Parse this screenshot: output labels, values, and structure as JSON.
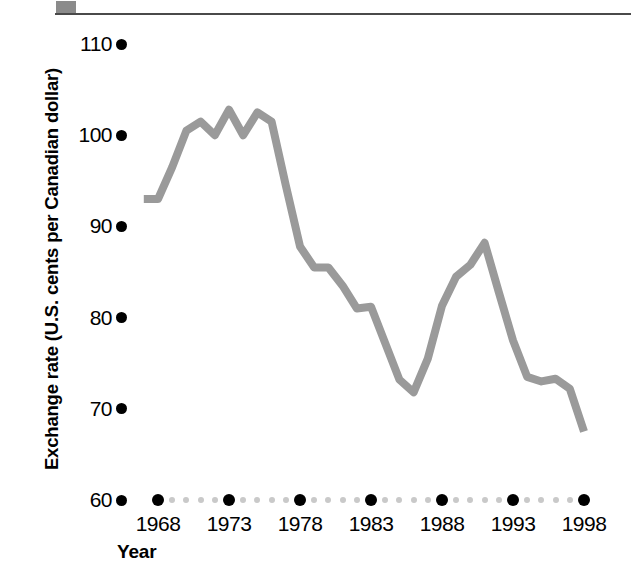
{
  "chart_data": {
    "type": "line",
    "title": "",
    "xlabel": "Year",
    "ylabel": "Exchange rate (U.S. cents per Canadian dollar)",
    "xlim": [
      1967,
      1998
    ],
    "ylim": [
      60,
      110
    ],
    "yticks": [
      110,
      100,
      90,
      80,
      70,
      60
    ],
    "xticks": [
      1968,
      1973,
      1978,
      1983,
      1988,
      1993,
      1998
    ],
    "grid": false,
    "legend": null,
    "series": [
      {
        "name": "Exchange rate",
        "color": "#9a9a9a",
        "x": [
          1967,
          1968,
          1969,
          1970,
          1971,
          1972,
          1973,
          1974,
          1975,
          1976,
          1977,
          1978,
          1979,
          1980,
          1981,
          1982,
          1983,
          1984,
          1985,
          1986,
          1987,
          1988,
          1989,
          1990,
          1991,
          1992,
          1993,
          1994,
          1995,
          1996,
          1997,
          1998
        ],
        "values": [
          93.0,
          93.0,
          96.5,
          100.5,
          101.5,
          100.0,
          102.8,
          100.0,
          102.5,
          101.5,
          94.5,
          87.8,
          85.5,
          85.5,
          83.5,
          81.0,
          81.2,
          77.2,
          73.2,
          71.8,
          75.5,
          81.3,
          84.5,
          85.8,
          88.2,
          82.8,
          77.5,
          73.5,
          73.0,
          73.3,
          72.2,
          67.5
        ]
      }
    ]
  },
  "axis": {
    "y_tick_labels": [
      "110",
      "100",
      "90",
      "80",
      "70",
      "60"
    ],
    "x_tick_labels": [
      "1968",
      "1973",
      "1978",
      "1983",
      "1988",
      "1993",
      "1998"
    ],
    "x_axis_title": "Year",
    "y_axis_title": "Exchange rate (U.S. cents per Canadian dollar)"
  },
  "colors": {
    "line": "#9a9a9a",
    "tick_dot": "#000000",
    "minor_dot": "#c9c9c9",
    "rule": "#4a4a4a",
    "block": "#8b8b8b"
  }
}
